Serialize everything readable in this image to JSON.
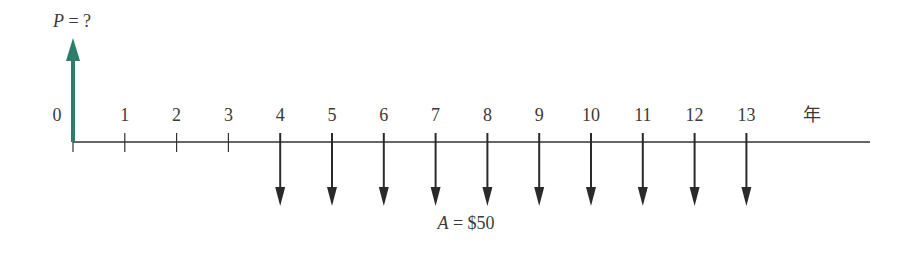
{
  "diagram": {
    "type": "cash-flow-diagram",
    "present_value_label": {
      "var": "P",
      "rest": " = ?"
    },
    "annuity_label": {
      "var": "A",
      "rest": " = $50"
    },
    "unit_label": "年",
    "periods": [
      "0",
      "1",
      "2",
      "3",
      "4",
      "5",
      "6",
      "7",
      "8",
      "9",
      "10",
      "11",
      "12",
      "13"
    ],
    "outflow_periods": [
      4,
      5,
      6,
      7,
      8,
      9,
      10,
      11,
      12,
      13
    ],
    "inflow_period": 0,
    "colors": {
      "inflow_arrow": "#2e7d6b",
      "outflow_arrow": "#2a2a2a",
      "axis": "#333333",
      "text": "#3a3a3a"
    }
  }
}
